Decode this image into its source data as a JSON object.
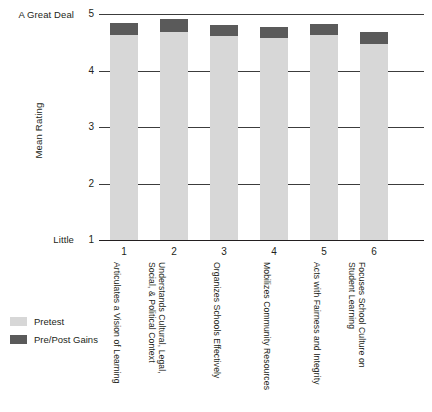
{
  "chart_data": {
    "type": "bar",
    "stacked": true,
    "title": "",
    "xlabel": "",
    "ylabel": "Mean Rating",
    "ylim": [
      1,
      5
    ],
    "yticks": [
      1,
      2,
      3,
      4,
      5
    ],
    "ytick_labels": [
      "1",
      "2",
      "3",
      "4",
      "5"
    ],
    "grid": true,
    "legend_position": "bottom-left",
    "scale_anchors": {
      "high_label": "A Great Deal",
      "high_value": 5,
      "low_label": "Little",
      "low_value": 1
    },
    "xtick_labels": [
      "1",
      "2",
      "3",
      "4",
      "5",
      "6"
    ],
    "categories": [
      "Articulates a Vision of Learning",
      "Understands Cultural, Legal,\nSocial, & Political Context",
      "Organizes Schools Effectively",
      "Mobilizes Community Resources",
      "Acts with Fairness and Integrity",
      "Focuses School Culture on\nStudent Learning"
    ],
    "series": [
      {
        "name": "Pretest",
        "color": "#d7d7d7",
        "values": [
          4.63,
          4.68,
          4.61,
          4.58,
          4.63,
          4.47
        ]
      },
      {
        "name": "Pre/Post Gains",
        "color": "#5a5a5a",
        "values": [
          0.21,
          0.23,
          0.19,
          0.19,
          0.19,
          0.21
        ]
      }
    ],
    "totals": [
      4.84,
      4.91,
      4.8,
      4.77,
      4.82,
      4.68
    ]
  },
  "legend": {
    "items": [
      {
        "label": "Pretest",
        "color": "#d7d7d7"
      },
      {
        "label": "Pre/Post Gains",
        "color": "#5a5a5a"
      }
    ]
  }
}
